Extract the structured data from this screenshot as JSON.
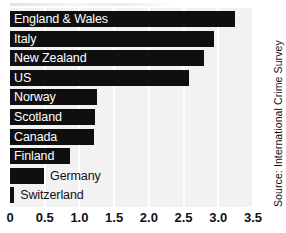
{
  "chart_data": {
    "type": "bar",
    "orientation": "horizontal",
    "title": "",
    "xlabel": "",
    "ylabel": "",
    "xlim": [
      0,
      3.5
    ],
    "xticks": [
      "0",
      "0.5",
      "1.0",
      "1.5",
      "2.0",
      "2.5",
      "3.0",
      "3.5"
    ],
    "xtick_values": [
      0,
      0.5,
      1.0,
      1.5,
      2.0,
      2.5,
      3.0,
      3.5
    ],
    "grid": "vertical-white-gridlines",
    "legend": "none",
    "categories": [
      "England & Wales",
      "Italy",
      "New Zealand",
      "US",
      "Norway",
      "Scotland",
      "Canada",
      "Finland",
      "Germany",
      "Switzerland"
    ],
    "values": [
      3.24,
      2.94,
      2.79,
      2.58,
      1.26,
      1.22,
      1.21,
      0.86,
      0.49,
      0.06
    ],
    "bar_color": "#100f0f",
    "plot_background": "#f2f2f2",
    "label_placement": [
      "inside",
      "inside",
      "inside",
      "inside",
      "inside",
      "inside",
      "inside",
      "inside",
      "outside",
      "outside"
    ],
    "source": "Source: International Crime Survey"
  },
  "axis": {
    "ticks": [
      {
        "label": "0",
        "value": 0
      },
      {
        "label": "0.5",
        "value": 0.5
      },
      {
        "label": "1.0",
        "value": 1.0
      },
      {
        "label": "1.5",
        "value": 1.5
      },
      {
        "label": "2.0",
        "value": 2.0
      },
      {
        "label": "2.5",
        "value": 2.5
      },
      {
        "label": "3.0",
        "value": 3.0
      },
      {
        "label": "3.5",
        "value": 3.5
      }
    ]
  },
  "source_note": {
    "text": "Source: International Crime Survey"
  }
}
